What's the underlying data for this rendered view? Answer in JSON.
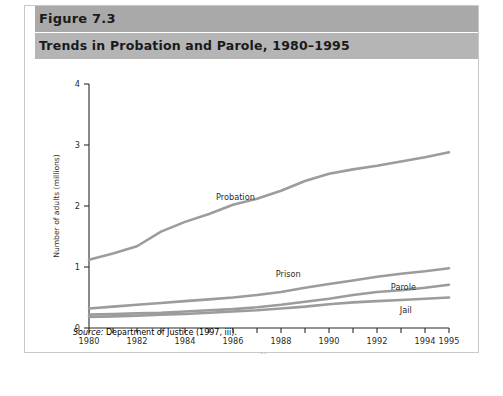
{
  "figure": {
    "number_label": "Figure 7.3",
    "title": "Trends in Probation and Parole, 1980–1995",
    "source_prefix": "Source:",
    "source_text": " Department of Justice (1997, iii)."
  },
  "colors": {
    "header_top_bar": "#a9a9a9",
    "header_sub_bar": "#b5b5b5",
    "series_line": "#9c9c9c",
    "axis": "#2b2b2b",
    "plot_background": "#ffffff",
    "figure_border": "#c9c9c9"
  },
  "chart_data": {
    "type": "line",
    "title": "Trends in Probation and Parole, 1980–1995",
    "xlabel": "Year",
    "ylabel": "Number of adults (millions)",
    "xlim": [
      1980,
      1995
    ],
    "ylim": [
      0,
      4
    ],
    "yticks": [
      0,
      1,
      2,
      3,
      4
    ],
    "ytick_labels": [
      "0",
      "1",
      "2",
      "3",
      "4"
    ],
    "xticks": [
      1980,
      1981,
      1982,
      1983,
      1984,
      1985,
      1986,
      1987,
      1988,
      1989,
      1990,
      1991,
      1992,
      1993,
      1994,
      1995
    ],
    "xtick_labels": [
      "1980",
      "1982",
      "1984",
      "1986",
      "1988",
      "1990",
      "1992",
      "1994",
      "1995"
    ],
    "xtick_label_years": [
      1980,
      1982,
      1984,
      1986,
      1988,
      1990,
      1992,
      1994,
      1995
    ],
    "grid": false,
    "legend": "inline-labels",
    "x": [
      1980,
      1981,
      1982,
      1983,
      1984,
      1985,
      1986,
      1987,
      1988,
      1989,
      1990,
      1991,
      1992,
      1993,
      1994,
      1995
    ],
    "series": [
      {
        "name": "Probation",
        "label": "Probation",
        "label_x": 1986.1,
        "label_y": 2.1,
        "values": [
          1.12,
          1.22,
          1.34,
          1.58,
          1.74,
          1.87,
          2.02,
          2.12,
          2.25,
          2.41,
          2.53,
          2.6,
          2.66,
          2.73,
          2.8,
          2.88
        ]
      },
      {
        "name": "Prison",
        "label": "Prison",
        "label_x": 1988.3,
        "label_y": 0.84,
        "values": [
          0.32,
          0.35,
          0.38,
          0.41,
          0.44,
          0.47,
          0.5,
          0.54,
          0.59,
          0.66,
          0.72,
          0.78,
          0.84,
          0.89,
          0.93,
          0.98
        ]
      },
      {
        "name": "Parole",
        "label": "Parole",
        "label_x": 1993.1,
        "label_y": 0.62,
        "values": [
          0.22,
          0.23,
          0.24,
          0.25,
          0.27,
          0.29,
          0.31,
          0.34,
          0.38,
          0.43,
          0.48,
          0.54,
          0.59,
          0.62,
          0.66,
          0.71
        ]
      },
      {
        "name": "Jail",
        "label": "Jail",
        "label_x": 1993.2,
        "label_y": 0.25,
        "values": [
          0.18,
          0.19,
          0.2,
          0.22,
          0.23,
          0.25,
          0.27,
          0.29,
          0.32,
          0.35,
          0.39,
          0.42,
          0.44,
          0.46,
          0.48,
          0.5
        ]
      }
    ]
  }
}
